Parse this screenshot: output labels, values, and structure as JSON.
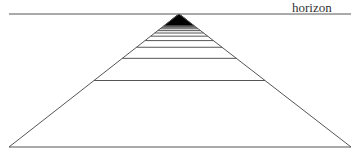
{
  "diagram": {
    "horizon_label": "horizon",
    "horizon": {
      "y": 14,
      "x1": 9,
      "x2": 351
    },
    "apex": {
      "x": 179,
      "y": 14
    },
    "base": {
      "y": 147,
      "x1": 9,
      "x2": 351
    },
    "rung_count": 60,
    "colors": {
      "line": "#555555",
      "ink": "#000000",
      "background": "#ffffff"
    }
  }
}
